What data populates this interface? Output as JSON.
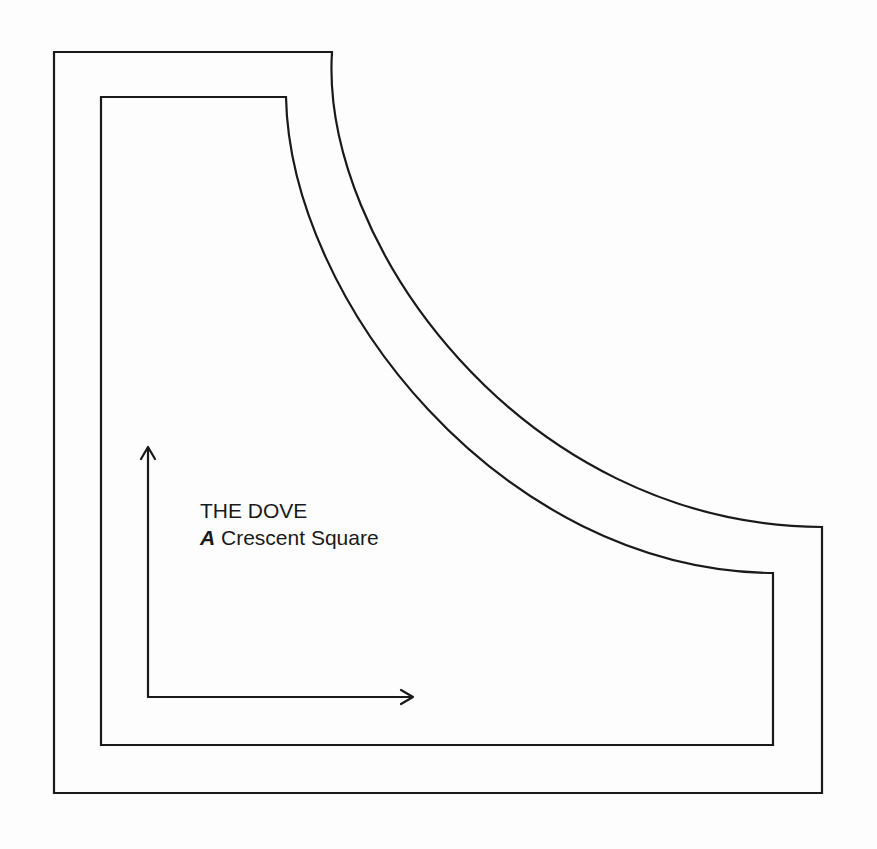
{
  "diagram": {
    "type": "quilt-template-piece",
    "title": "THE DOVE",
    "piece_letter": "A",
    "piece_name": "Crescent Square",
    "outer_outline": {
      "description": "cutting line (outer seam allowance)",
      "points": {
        "top_left": [
          54,
          52
        ],
        "arc_start": [
          332,
          52
        ],
        "arc_end": [
          822,
          527
        ],
        "bottom_right": [
          822,
          793
        ],
        "bottom_left": [
          54,
          793
        ]
      }
    },
    "inner_outline": {
      "description": "sewing line",
      "points": {
        "top_left": [
          101,
          97
        ],
        "arc_start": [
          286,
          97
        ],
        "arc_end": [
          773,
          573
        ],
        "bottom_right": [
          773,
          745
        ],
        "bottom_left": [
          101,
          745
        ]
      }
    },
    "grain_arrows": {
      "vertical": {
        "from": [
          148,
          697
        ],
        "to": [
          148,
          447
        ]
      },
      "horizontal": {
        "from": [
          148,
          697
        ],
        "to": [
          413,
          697
        ]
      }
    },
    "colors": {
      "line": "#1a1a1a",
      "background": "#fdfdfd"
    }
  }
}
